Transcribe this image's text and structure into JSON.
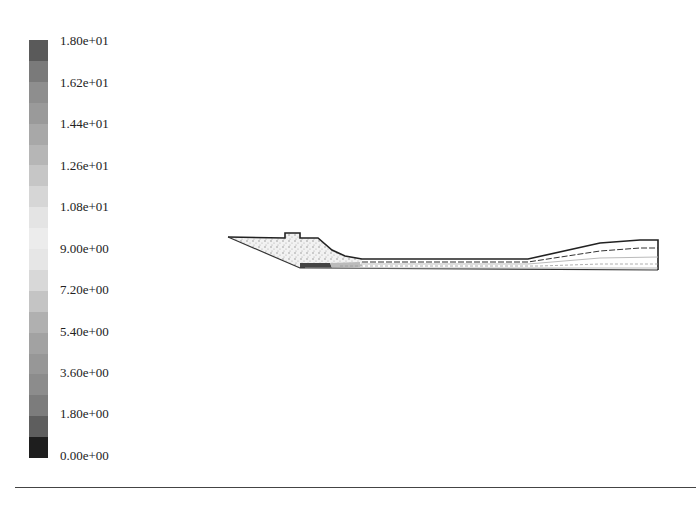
{
  "chart_data": {
    "type": "heatmap",
    "title": "",
    "xlabel": "",
    "ylabel": "",
    "colorbar": {
      "min": 0.0,
      "max": 18.0,
      "tick_labels": [
        "1.80e+01",
        "1.62e+01",
        "1.44e+01",
        "1.26e+01",
        "1.08e+01",
        "9.00e+00",
        "7.20e+00",
        "5.40e+00",
        "3.60e+00",
        "1.80e+00",
        "0.00e+00"
      ],
      "tick_values": [
        18.0,
        16.2,
        14.4,
        12.6,
        10.8,
        9.0,
        7.2,
        5.4,
        3.6,
        1.8,
        0.0
      ],
      "bands": 20,
      "colormap": "grayscale"
    },
    "grid": false,
    "legend_position": "left"
  },
  "colorbar": {
    "labels": [
      "1.80e+01",
      "1.62e+01",
      "1.44e+01",
      "1.26e+01",
      "1.08e+01",
      "9.00e+00",
      "7.20e+00",
      "5.40e+00",
      "3.60e+00",
      "1.80e+00",
      "0.00e+00"
    ],
    "band_colors": [
      "#5a5a5a",
      "#7a7a7a",
      "#8e8e8e",
      "#9a9a9a",
      "#a8a8a8",
      "#b6b6b6",
      "#c6c6c6",
      "#d6d6d6",
      "#e4e4e4",
      "#ececec",
      "#e6e6e6",
      "#d8d8d8",
      "#c4c4c4",
      "#b0b0b0",
      "#a2a2a2",
      "#979797",
      "#8c8c8c",
      "#7c7c7c",
      "#5e5e5e",
      "#1e1e1e"
    ]
  },
  "contour_plot": {
    "outline_color": "#222222",
    "fill_color": "#d8d8d8"
  }
}
